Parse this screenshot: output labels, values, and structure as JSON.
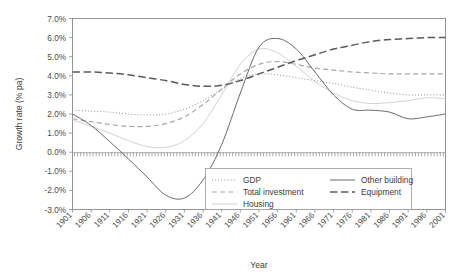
{
  "chart_data": {
    "type": "line",
    "title": "",
    "xlabel": "Year",
    "ylabel": "Growth rate (% pa)",
    "xlim": [
      1901,
      2001
    ],
    "ylim": [
      -0.03,
      0.07
    ],
    "grid": false,
    "legend_position": "bottom-center-inside",
    "y_tick_labels": [
      "7.0%",
      "6.0%",
      "5.0%",
      "4.0%",
      "3.0%",
      "2.0%",
      "1.0%",
      "0.0%",
      "-1.0%",
      "-2.0%",
      "-3.0%"
    ],
    "y_tick_values": [
      7.0,
      6.0,
      5.0,
      4.0,
      3.0,
      2.0,
      1.0,
      0.0,
      -1.0,
      -2.0,
      -3.0
    ],
    "x_tick_labels": [
      "1901",
      "1906",
      "1911",
      "1916",
      "1921",
      "1926",
      "1931",
      "1936",
      "1941",
      "1946",
      "1951",
      "1956",
      "1961",
      "1966",
      "1971",
      "1976",
      "1981",
      "1986",
      "1991",
      "1996",
      "2001"
    ],
    "x": [
      1901,
      1906,
      1911,
      1916,
      1921,
      1926,
      1931,
      1936,
      1941,
      1946,
      1951,
      1956,
      1961,
      1966,
      1971,
      1976,
      1981,
      1986,
      1991,
      1996,
      2001
    ],
    "series": [
      {
        "name": "GDP",
        "style": "dotted",
        "color": "#909090",
        "values": [
          2.2,
          2.15,
          2.1,
          2.0,
          1.95,
          2.0,
          2.25,
          2.7,
          3.3,
          3.85,
          4.1,
          4.05,
          3.9,
          3.75,
          3.6,
          3.4,
          3.25,
          3.1,
          3.0,
          3.0,
          3.0
        ]
      },
      {
        "name": "Total investment",
        "style": "dashed",
        "color": "#a8a8a8",
        "values": [
          1.75,
          1.6,
          1.45,
          1.35,
          1.35,
          1.5,
          1.85,
          2.5,
          3.3,
          4.1,
          4.6,
          4.75,
          4.6,
          4.4,
          4.3,
          4.2,
          4.15,
          4.1,
          4.1,
          4.1,
          4.1
        ]
      },
      {
        "name": "Housing",
        "style": "solid",
        "color": "#d2d2d2",
        "values": [
          1.7,
          1.35,
          1.0,
          0.6,
          0.3,
          0.25,
          0.6,
          1.5,
          3.0,
          4.6,
          5.4,
          5.2,
          4.5,
          3.7,
          3.1,
          2.7,
          2.55,
          2.6,
          2.7,
          2.85,
          2.8
        ]
      },
      {
        "name": "Other building",
        "style": "solid",
        "color": "#6a6a6a",
        "values": [
          2.0,
          1.4,
          0.55,
          -0.35,
          -1.3,
          -2.25,
          -2.4,
          -1.45,
          0.4,
          3.1,
          5.5,
          5.95,
          5.4,
          4.2,
          3.0,
          2.25,
          2.2,
          2.1,
          1.75,
          1.85,
          2.0
        ]
      },
      {
        "name": "Equipment",
        "style": "longdash",
        "color": "#5a5a5a",
        "values": [
          4.2,
          4.2,
          4.15,
          4.05,
          3.9,
          3.75,
          3.55,
          3.45,
          3.5,
          3.75,
          4.1,
          4.45,
          4.8,
          5.1,
          5.4,
          5.6,
          5.8,
          5.9,
          5.95,
          6.0,
          6.0
        ]
      }
    ]
  },
  "legend": {
    "entries": [
      {
        "label": "GDP"
      },
      {
        "label": "Total investment"
      },
      {
        "label": "Housing"
      },
      {
        "label": "Other building"
      },
      {
        "label": "Equipment"
      }
    ]
  }
}
